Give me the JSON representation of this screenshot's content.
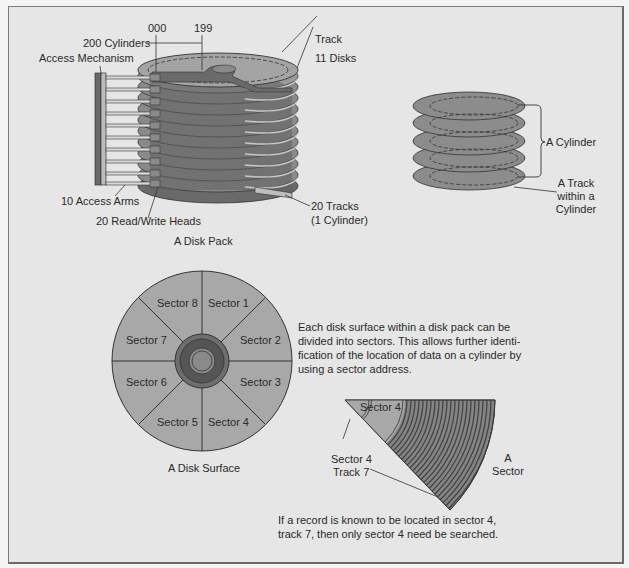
{
  "disk_pack": {
    "title": "A Disk Pack",
    "labels": {
      "start_cylinder": "000",
      "end_cylinder": "199",
      "cylinders": "200 Cylinders",
      "access_mechanism": "Access Mechanism",
      "track": "Track",
      "disks": "11 Disks",
      "access_arms": "10 Access Arms",
      "heads": "20 Read/Write Heads",
      "tracks_line1": "20 Tracks",
      "tracks_line2": "(1 Cylinder)"
    },
    "disk_count": 11,
    "arm_count": 10
  },
  "cylinder_diagram": {
    "cylinder_label": "A Cylinder",
    "track_label_line1": "A Track",
    "track_label_line2": "within a",
    "track_label_line3": "Cylinder",
    "platter_count": 5
  },
  "disk_surface": {
    "title": "A Disk Surface",
    "sectors": [
      "Sector 1",
      "Sector 2",
      "Sector 3",
      "Sector 4",
      "Sector 5",
      "Sector 6",
      "Sector 7",
      "Sector 8"
    ],
    "description": "Each disk surface within a disk pack can be divided into sectors. This allows further identification of the location of data on a cylinder by using a sector address.",
    "description_lines": [
      "Each disk surface within a disk pack can be",
      "divided into sectors. This allows further identi-",
      "fication of the location of data on a cylinder by",
      "using a sector address."
    ]
  },
  "sector_detail": {
    "sector_label": "Sector 4",
    "pointer_line1": "Sector 4",
    "pointer_line2": "Track 7",
    "side_line1": "A",
    "side_line2": "Sector",
    "caption_lines": [
      "If a record is known to be located in sector 4,",
      "track 7, then only sector 4 need be searched."
    ]
  },
  "colors": {
    "background": "#e6e6e6",
    "sector_fill": "#a8a8a8",
    "dark_fill": "#6e6e6e",
    "darker_fill": "#555555",
    "line": "#2a2a2a"
  }
}
